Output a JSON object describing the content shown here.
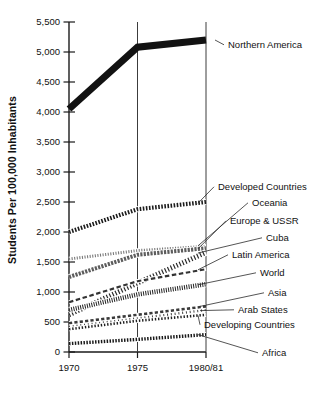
{
  "chart_data": {
    "type": "line",
    "title": "",
    "xlabel": "",
    "ylabel": "Students Per 100,000 Inhabitants",
    "x": [
      "1970",
      "1975",
      "1980/81"
    ],
    "xtick_labels": [
      "1970",
      "1975",
      "1980/81"
    ],
    "ytick_labels": [
      "0",
      "500",
      "1,000",
      "1,500",
      "2,000",
      "2,500",
      "3,000",
      "3,500",
      "4,000",
      "4,500",
      "5,000",
      "5,500"
    ],
    "ytick_values": [
      0,
      500,
      1000,
      1500,
      2000,
      2500,
      3000,
      3500,
      4000,
      4500,
      5000,
      5500
    ],
    "ylim": [
      0,
      5500
    ],
    "grid": "vertical",
    "legend_position": "right-inline-labels",
    "series": [
      {
        "name": "Northern America",
        "values": [
          4050,
          5080,
          5200
        ],
        "label": "Northern America",
        "style": "solid-thick"
      },
      {
        "name": "Developed Countries",
        "values": [
          2000,
          2380,
          2500
        ],
        "label": "Developed Countries",
        "style": "bead-chain"
      },
      {
        "name": "Oceania",
        "values": [
          1550,
          1690,
          1760
        ],
        "label": "Oceania",
        "style": "dotted-fine"
      },
      {
        "name": "Europe & USSR",
        "values": [
          1250,
          1620,
          1730
        ],
        "label": "Europe & USSR",
        "style": "dashed-grey"
      },
      {
        "name": "Cuba",
        "values": [
          620,
          1150,
          1660
        ],
        "label": "Cuba",
        "style": "hatch-steep"
      },
      {
        "name": "Latin America",
        "values": [
          830,
          1180,
          1380
        ],
        "label": "Latin America",
        "style": "dash-long"
      },
      {
        "name": "World",
        "values": [
          700,
          960,
          1130
        ],
        "label": "World",
        "style": "hatch-dense"
      },
      {
        "name": "Asia",
        "values": [
          480,
          620,
          760
        ],
        "label": "Asia",
        "style": "dash-thin"
      },
      {
        "name": "Arab States",
        "values": [
          420,
          560,
          700
        ],
        "label": "Arab States",
        "style": "dot-sparse"
      },
      {
        "name": "Developing Countries",
        "values": [
          380,
          520,
          620
        ],
        "label": "Developing Countries",
        "style": "dot-dash"
      },
      {
        "name": "Africa",
        "values": [
          140,
          210,
          290
        ],
        "label": "Africa",
        "style": "bead-small"
      }
    ]
  },
  "colors": {
    "axis": "#1a1a1a",
    "ink": "#111111",
    "grid": "#4a4a4a",
    "grey_series": "#6e6e6e",
    "background": "#ffffff"
  }
}
